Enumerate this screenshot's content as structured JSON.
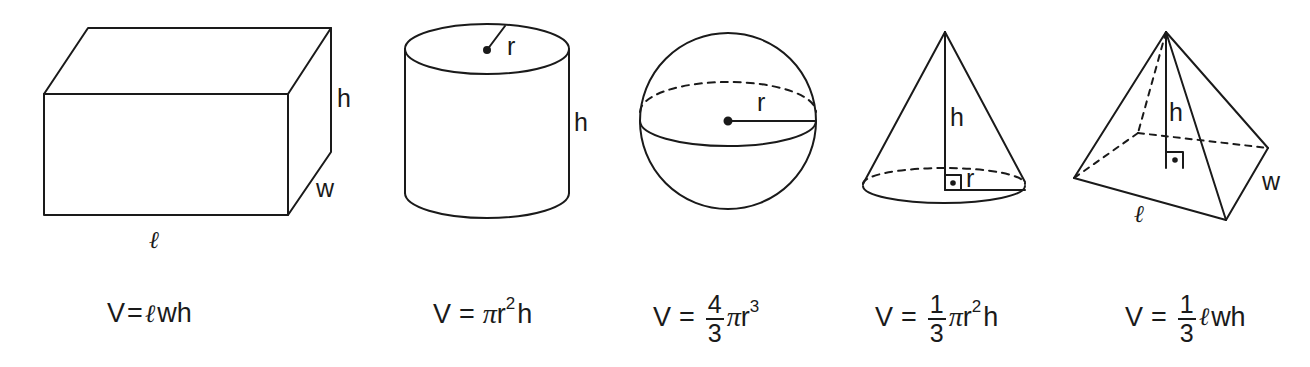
{
  "shapes": [
    {
      "name": "rectangular-prism",
      "labels": {
        "height": "h",
        "width": "w",
        "length": "ℓ"
      },
      "formula": {
        "lhs": "V",
        "eq": "=",
        "parts": [
          "ℓ",
          "wh"
        ],
        "text": "V=ℓwh"
      }
    },
    {
      "name": "cylinder",
      "labels": {
        "radius": "r",
        "height": "h"
      },
      "formula": {
        "lhs": "V",
        "eq": "=",
        "pi": "π",
        "base": "r",
        "exp": "2",
        "tail": "h",
        "text": "V = πr²h"
      }
    },
    {
      "name": "sphere",
      "labels": {
        "radius": "r"
      },
      "formula": {
        "lhs": "V",
        "eq": "=",
        "num": "4",
        "den": "3",
        "pi": "π",
        "base": "r",
        "exp": "3",
        "text": "V = 4/3 πr³"
      }
    },
    {
      "name": "cone",
      "labels": {
        "height": "h",
        "radius": "r"
      },
      "formula": {
        "lhs": "V",
        "eq": "=",
        "num": "1",
        "den": "3",
        "pi": "π",
        "base": "r",
        "exp": "2",
        "tail": "h",
        "text": "V = 1/3 πr²h"
      }
    },
    {
      "name": "pyramid",
      "labels": {
        "height": "h",
        "width": "w",
        "length": "ℓ"
      },
      "formula": {
        "lhs": "V",
        "eq": "=",
        "num": "1",
        "den": "3",
        "ell": "ℓ",
        "tail": "wh",
        "text": "V = 1/3 ℓwh"
      }
    }
  ],
  "colors": {
    "stroke": "#1a1a1a",
    "background": "#ffffff"
  }
}
